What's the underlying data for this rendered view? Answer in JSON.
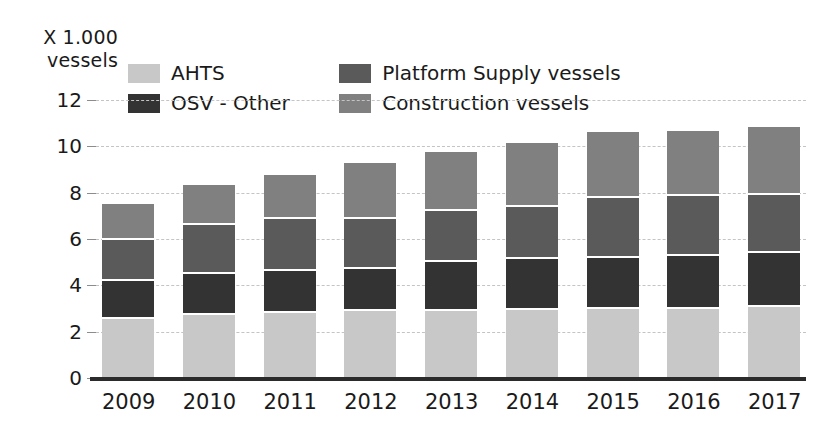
{
  "chart_data": {
    "type": "bar",
    "stacked": true,
    "title": "X 1.000\nvessels",
    "ylabel": "X 1.000 vessels",
    "xlabel": "",
    "categories": [
      "2009",
      "2010",
      "2011",
      "2012",
      "2013",
      "2014",
      "2015",
      "2016",
      "2017"
    ],
    "yticks": [
      12,
      10,
      8,
      6,
      4,
      2,
      0
    ],
    "ylim": [
      0,
      12
    ],
    "grid": true,
    "legend_position": "top-left",
    "series": [
      {
        "name": "AHTS",
        "color": "#c8c8c8",
        "values": [
          2.55,
          2.7,
          2.8,
          2.9,
          2.9,
          2.95,
          3.0,
          3.0,
          3.05
        ]
      },
      {
        "name": "OSV - Other",
        "color": "#333333",
        "values": [
          1.65,
          1.8,
          1.8,
          1.8,
          2.1,
          2.2,
          2.2,
          2.25,
          2.35
        ]
      },
      {
        "name": "Platform Supply vessels",
        "color": "#5a5a5a",
        "values": [
          1.75,
          2.1,
          2.25,
          2.15,
          2.2,
          2.25,
          2.55,
          2.6,
          2.5
        ]
      },
      {
        "name": "Construction vessels",
        "color": "#808080",
        "values": [
          1.55,
          1.75,
          1.9,
          2.45,
          2.55,
          2.75,
          2.85,
          2.8,
          2.95
        ]
      }
    ],
    "totals": [
      7.5,
      8.35,
      8.75,
      9.3,
      9.75,
      10.15,
      10.4,
      10.65,
      10.85
    ]
  },
  "legend": {
    "entries": [
      {
        "label": "AHTS",
        "color": "#c8c8c8"
      },
      {
        "label": "Platform Supply vessels",
        "color": "#5a5a5a"
      },
      {
        "label": "OSV - Other",
        "color": "#333333"
      },
      {
        "label": "Construction vessels",
        "color": "#808080"
      }
    ]
  },
  "colors": {
    "background": "#ffffff",
    "text": "#1a1a1a",
    "gridline": "#c4c4c4",
    "axis": "#2b2b2b"
  }
}
